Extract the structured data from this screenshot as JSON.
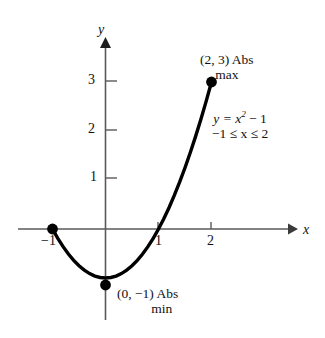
{
  "chart_data": {
    "type": "line",
    "title": "",
    "subtitle": "",
    "xlabel": "x",
    "ylabel": "y",
    "function_label_line1": "y = x",
    "function_label_exponent": "2",
    "function_label_line1_tail": " − 1",
    "function_label_line2": "−1 ≤ x ≤ 2",
    "domain": [
      -1,
      2
    ],
    "xlim": [
      -1.6,
      3.4
    ],
    "ylim": [
      -1.6,
      3.9
    ],
    "xticks": [
      -1,
      1,
      2
    ],
    "xtick_labels": [
      "−1",
      "1",
      "2"
    ],
    "yticks": [
      1,
      2,
      3
    ],
    "ytick_labels": [
      "1",
      "2",
      "3"
    ],
    "grid": false,
    "legend": "none",
    "axes_arrows": true,
    "series": [
      {
        "name": "y = x^2 - 1",
        "x": [
          -1.0,
          -0.9,
          -0.8,
          -0.7,
          -0.6,
          -0.5,
          -0.4,
          -0.3,
          -0.2,
          -0.1,
          0.0,
          0.1,
          0.2,
          0.3,
          0.4,
          0.5,
          0.6,
          0.7,
          0.8,
          0.9,
          1.0,
          1.1,
          1.2,
          1.3,
          1.4,
          1.5,
          1.6,
          1.7,
          1.8,
          1.9,
          2.0
        ],
        "y": [
          0.0,
          -0.19,
          -0.36,
          -0.51,
          -0.64,
          -0.75,
          -0.84,
          -0.91,
          -0.96,
          -0.99,
          -1.0,
          -0.99,
          -0.96,
          -0.91,
          -0.84,
          -0.75,
          -0.64,
          -0.51,
          -0.36,
          -0.19,
          0.0,
          0.21,
          0.44,
          0.69,
          0.96,
          1.25,
          1.56,
          1.89,
          2.24,
          2.61,
          3.0
        ]
      }
    ],
    "points": [
      {
        "name": "left-endpoint",
        "x": -1,
        "y": 0,
        "label": ""
      },
      {
        "name": "abs-min-vertex",
        "x": 0,
        "y": -1,
        "label": "(0, −1)"
      },
      {
        "name": "abs-max-endpoint",
        "x": 2,
        "y": 3,
        "label": "(2, 3)"
      }
    ],
    "annotations": [
      {
        "name": "abs-max",
        "line1": "(2, 3) Abs",
        "line2": "max",
        "at_point": [
          2,
          3
        ]
      },
      {
        "name": "abs-min",
        "line1": "(0, −1)  Abs",
        "line2": "min",
        "at_point": [
          0,
          -1
        ]
      }
    ],
    "colors": {
      "curve": "#000000",
      "axis": "#5a5a5a",
      "point": "#000000",
      "text": "#111111",
      "background": "#ffffff"
    }
  },
  "axis_labels": {
    "x": "x",
    "y": "y"
  },
  "ticks": {
    "x_neg1": "−1",
    "x_1": "1",
    "x_2": "2",
    "y_1": "1",
    "y_2": "2",
    "y_3": "3"
  },
  "annotations": {
    "max_line1": "(2, 3) Abs",
    "max_line2": "max",
    "eq_prefix": "y = x",
    "eq_exponent": "2",
    "eq_suffix": " − 1",
    "eq_domain": "−1 ≤ x ≤ 2",
    "min_line1": "(0, −1)  Abs",
    "min_line2": "min"
  }
}
